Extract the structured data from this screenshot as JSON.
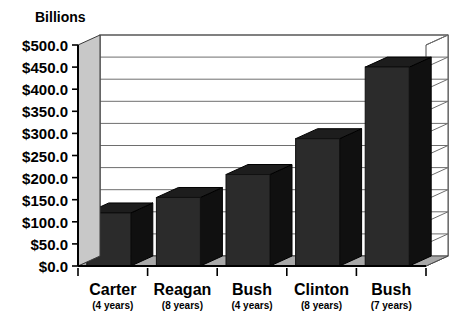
{
  "chart_data": {
    "type": "bar",
    "title": "",
    "axis_unit_label": "Billions",
    "xlabel": "",
    "ylabel": "Billions",
    "ylim": [
      0,
      500
    ],
    "ytick_labels": [
      "$500.0",
      "$450.0",
      "$400.0",
      "$350.0",
      "$300.0",
      "$250.0",
      "$200.0",
      "$150.0",
      "$100.0",
      "$50.0",
      "$0.0"
    ],
    "ytick_values": [
      500,
      450,
      400,
      350,
      300,
      250,
      200,
      150,
      100,
      50,
      0
    ],
    "ytick_interval": 50,
    "grid": true,
    "legend": "none",
    "style": "3d-column",
    "categories": [
      "Carter",
      "Reagan",
      "Bush",
      "Clinton",
      "Bush"
    ],
    "category_sublabels": [
      "(4 years)",
      "(8 years)",
      "(4 years)",
      "(8 years)",
      "(7 years)"
    ],
    "values": [
      120,
      155,
      207,
      288,
      450
    ],
    "bars": [
      {
        "label": "Carter",
        "sublabel": "(4 years)",
        "value": 120
      },
      {
        "label": "Reagan",
        "sublabel": "(8 years)",
        "value": 155
      },
      {
        "label": "Bush",
        "sublabel": "(4 years)",
        "value": 207
      },
      {
        "label": "Clinton",
        "sublabel": "(8 years)",
        "value": 288
      },
      {
        "label": "Bush",
        "sublabel": "(7 years)",
        "value": 450
      }
    ],
    "colors": {
      "bar_front": "#2b2b2b",
      "bar_side": "#101010",
      "bar_top": "#1d1d1d",
      "gridline": "#6e6e6e",
      "wall": "#ffffff",
      "floor": "#a8a8a8",
      "axis": "#000000",
      "text": "#000000"
    }
  }
}
